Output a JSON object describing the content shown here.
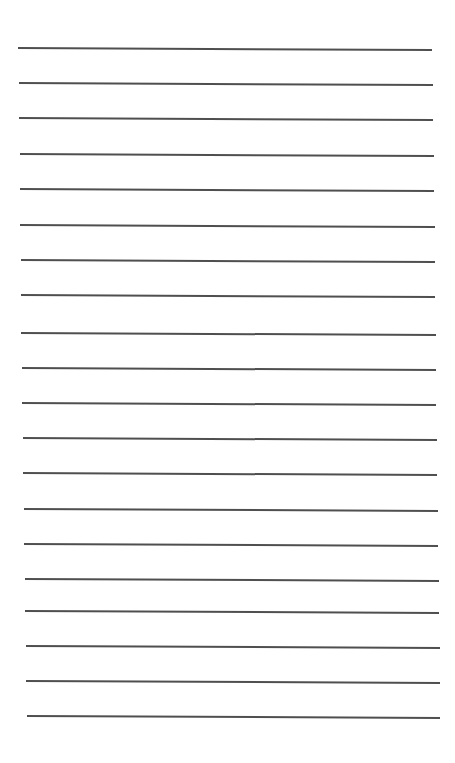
{
  "page": {
    "type": "lined-paper",
    "background_color": "#ffffff",
    "line_color": "#3c3c3c",
    "line_thickness_px": 2,
    "line_count": 20,
    "line_spacing_px": 35,
    "lines": [
      {
        "y": 48,
        "x_start": 18,
        "x_end": 432,
        "tilt_px": 2
      },
      {
        "y": 83,
        "x_start": 19,
        "x_end": 433,
        "tilt_px": 2
      },
      {
        "y": 118,
        "x_start": 19,
        "x_end": 433,
        "tilt_px": 2
      },
      {
        "y": 154,
        "x_start": 20,
        "x_end": 434,
        "tilt_px": 2
      },
      {
        "y": 189,
        "x_start": 20,
        "x_end": 434,
        "tilt_px": 2
      },
      {
        "y": 225,
        "x_start": 20,
        "x_end": 435,
        "tilt_px": 2
      },
      {
        "y": 260,
        "x_start": 21,
        "x_end": 435,
        "tilt_px": 2
      },
      {
        "y": 295,
        "x_start": 21,
        "x_end": 435,
        "tilt_px": 2
      },
      {
        "y": 333,
        "x_start": 21,
        "x_end": 436,
        "tilt_px": 2
      },
      {
        "y": 368,
        "x_start": 22,
        "x_end": 436,
        "tilt_px": 2
      },
      {
        "y": 403,
        "x_start": 22,
        "x_end": 436,
        "tilt_px": 2
      },
      {
        "y": 438,
        "x_start": 23,
        "x_end": 437,
        "tilt_px": 2
      },
      {
        "y": 473,
        "x_start": 23,
        "x_end": 437,
        "tilt_px": 2
      },
      {
        "y": 509,
        "x_start": 24,
        "x_end": 438,
        "tilt_px": 2
      },
      {
        "y": 544,
        "x_start": 24,
        "x_end": 438,
        "tilt_px": 2
      },
      {
        "y": 579,
        "x_start": 25,
        "x_end": 439,
        "tilt_px": 2
      },
      {
        "y": 611,
        "x_start": 25,
        "x_end": 439,
        "tilt_px": 2
      },
      {
        "y": 646,
        "x_start": 26,
        "x_end": 440,
        "tilt_px": 2
      },
      {
        "y": 681,
        "x_start": 26,
        "x_end": 440,
        "tilt_px": 2
      },
      {
        "y": 716,
        "x_start": 27,
        "x_end": 440,
        "tilt_px": 2
      }
    ]
  }
}
